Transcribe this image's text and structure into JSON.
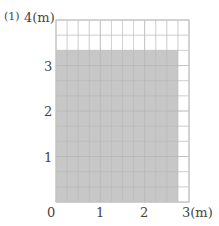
{
  "problem_label": "(1)",
  "chart_data": {
    "type": "area",
    "title": "",
    "xlabel": "3(m)",
    "ylabel": "4(m)",
    "x_ticks": [
      "0",
      "1",
      "2",
      "3(m)"
    ],
    "y_ticks": [
      "1",
      "2",
      "3",
      "4(m)"
    ],
    "xlim": [
      0,
      3
    ],
    "ylim": [
      0,
      4
    ],
    "grid": true,
    "grid_step_x": 0.25,
    "grid_step_y": 0.3333,
    "shaded_rectangle": {
      "x0": 0,
      "y0": 0,
      "width": 2.75,
      "height": 3.3333
    },
    "colors": {
      "fill": "#c4c4c4",
      "grid": "#d8d8d8",
      "axis": "#bbbbbb"
    }
  },
  "labels": {
    "origin": "0",
    "x1": "1",
    "x2": "2",
    "x3": "3(m)",
    "y1": "1",
    "y2": "2",
    "y3": "3",
    "y4": "4(m)"
  }
}
